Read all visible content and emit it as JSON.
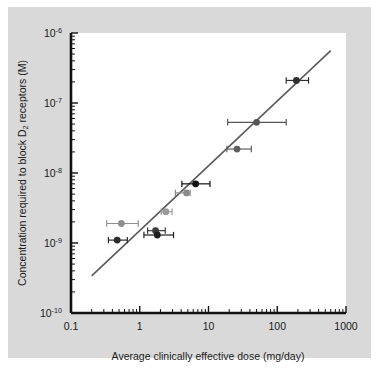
{
  "chart_data": {
    "type": "scatter",
    "title": "",
    "xlabel": "Average clinically effective dose (mg/day)",
    "ylabel": "Concentration required to block D2 receptors (M)",
    "ylabel_main_before": "Concentration required to block D",
    "ylabel_sub": "2",
    "ylabel_main_after": " receptors (M)",
    "xscale": "log",
    "yscale": "log",
    "xlim": [
      0.1,
      1000
    ],
    "ylim": [
      1e-10,
      1e-06
    ],
    "grid": false,
    "legend": false,
    "xticks": [
      {
        "value": 0.1,
        "label": "0.1"
      },
      {
        "value": 1,
        "label": "1"
      },
      {
        "value": 10,
        "label": "10"
      },
      {
        "value": 100,
        "label": "100"
      },
      {
        "value": 1000,
        "label": "1000"
      }
    ],
    "yticks": [
      {
        "value": 1e-06,
        "mantissa": "10",
        "exponent": "-6"
      },
      {
        "value": 1e-07,
        "mantissa": "10",
        "exponent": "-7"
      },
      {
        "value": 1e-08,
        "mantissa": "10",
        "exponent": "-8"
      },
      {
        "value": 1e-09,
        "mantissa": "10",
        "exponent": "-9"
      },
      {
        "value": 1e-10,
        "mantissa": "10",
        "exponent": "-10"
      }
    ],
    "points": [
      {
        "x": 0.54,
        "y": 1.9e-09,
        "xerr_low": 0.33,
        "xerr_high": 0.95,
        "color": "#8f8f8f"
      },
      {
        "x": 0.47,
        "y": 1.1e-09,
        "xerr_low": 0.35,
        "xerr_high": 0.66,
        "color": "#2b2b2b"
      },
      {
        "x": 1.7,
        "y": 1.5e-09,
        "xerr_low": 1.3,
        "xerr_high": 2.35,
        "color": "#3a3a3a"
      },
      {
        "x": 1.8,
        "y": 1.3e-09,
        "xerr_low": 1.15,
        "xerr_high": 3.1,
        "color": "#1e1e1e"
      },
      {
        "x": 2.4,
        "y": 2.8e-09,
        "xerr_low": 2.05,
        "xerr_high": 2.95,
        "color": "#9a9a9a"
      },
      {
        "x": 4.8,
        "y": 5.2e-09,
        "xerr_low": 3.3,
        "xerr_high": 5.4,
        "color": "#8a8a8a"
      },
      {
        "x": 6.5,
        "y": 7e-09,
        "xerr_low": 4.1,
        "xerr_high": 10.5,
        "color": "#101010"
      },
      {
        "x": 26.0,
        "y": 2.2e-08,
        "xerr_low": 18.5,
        "xerr_high": 42.0,
        "color": "#5f5f5f"
      },
      {
        "x": 50.0,
        "y": 5.3e-08,
        "xerr_low": 19.0,
        "xerr_high": 135.0,
        "color": "#555555"
      },
      {
        "x": 190.0,
        "y": 2.1e-07,
        "xerr_low": 135.0,
        "xerr_high": 285.0,
        "color": "#2e2e2e"
      }
    ],
    "fit_line": {
      "x_start": 0.2,
      "y_start": 3.4e-10,
      "x_end": 600,
      "y_end": 5.6e-07,
      "color": "#5a5a5a"
    },
    "colors": {
      "figure_background": "#d9d9d9",
      "plot_background": "#ffffff",
      "axis": "#111111",
      "text": "#1a1a1a",
      "fit_line": "#5a5a5a"
    }
  }
}
